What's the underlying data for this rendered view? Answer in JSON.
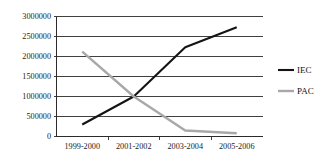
{
  "chart_data": {
    "type": "line",
    "title": "",
    "xlabel": "",
    "ylabel": "",
    "categories": [
      "1999-2000",
      "2001-2002",
      "2003-2004",
      "2005-2006"
    ],
    "ylim": [
      0,
      3000000
    ],
    "yticks": [
      0,
      500000,
      1000000,
      1500000,
      2000000,
      2500000,
      3000000
    ],
    "ytick_labels": [
      "0",
      "500000",
      "1000000",
      "1500000",
      "2000000",
      "2500000",
      "3000000"
    ],
    "grid": true,
    "legend_position": "right",
    "series": [
      {
        "name": "IEC",
        "color": "#141414",
        "width": 2.1,
        "values": [
          300000,
          1000000,
          2230000,
          2730000
        ]
      },
      {
        "name": "PAC",
        "color": "#a8a8a8",
        "width": 2.4,
        "values": [
          2120000,
          1000000,
          150000,
          80000
        ]
      }
    ]
  },
  "legend": {
    "items": [
      {
        "label": "IEC",
        "color": "#141414"
      },
      {
        "label": "PAC",
        "color": "#a8a8a8"
      }
    ]
  }
}
